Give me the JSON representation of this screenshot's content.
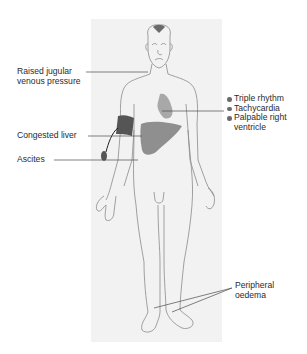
{
  "diagram": {
    "labels_left": {
      "jvp": [
        "Raised jugular",
        "venous pressure"
      ],
      "liver": "Congested liver",
      "ascites": "Ascites"
    },
    "labels_right": {
      "cardiac_signs": [
        {
          "text": "Triple rhythm"
        },
        {
          "text": "Tachycardia"
        },
        {
          "text": "Palpable right",
          "continuation": "ventricle"
        }
      ],
      "oedema": [
        "Peripheral",
        "oedema"
      ]
    },
    "colors": {
      "panel_bg": "#f2f2f2",
      "outline": "#8a8a8a",
      "heart": "#a8a8a8",
      "liver": "#8f8f8f",
      "bp_cuff": "#555555",
      "leader_line": "#4a4a4a",
      "text": "#2b2b2b"
    }
  }
}
